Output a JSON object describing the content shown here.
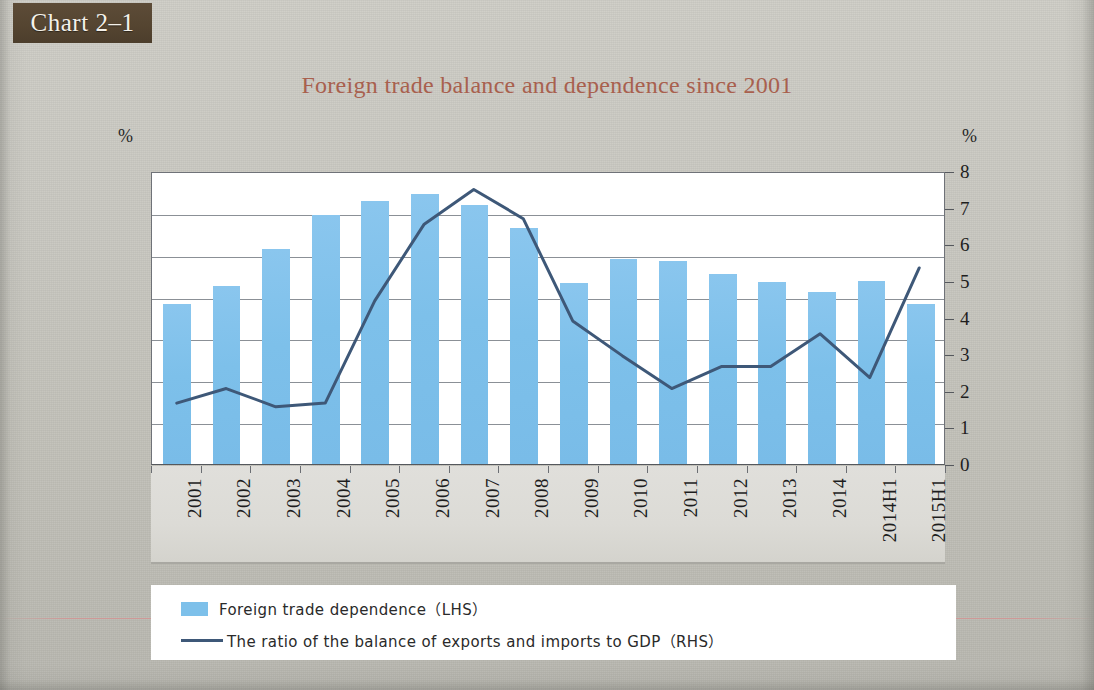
{
  "badge": {
    "label": "Chart 2–1"
  },
  "title": "Foreign trade balance and dependence since 2001",
  "axes": {
    "left_unit": "%",
    "right_unit": "%"
  },
  "colors": {
    "bar": "#7dc0ea",
    "line": "#3e5878",
    "title": "#a8604e",
    "badge_bg": "#554531",
    "page_bg": "#c7c6bf",
    "plot_bg": "#ffffff",
    "gridline": "#8b9096",
    "category_band": "#dcdbd6"
  },
  "legend": {
    "items": [
      {
        "marker": "box",
        "label": "Foreign  trade  dependence（LHS）"
      },
      {
        "marker": "line",
        "label": "The ratio of the balance of exports and imports to GDP（RHS）"
      }
    ]
  },
  "chart_data": {
    "type": "bar",
    "title": "Foreign trade balance and dependence since 2001",
    "xlabel": "",
    "ylabel": "%",
    "y2label": "%",
    "ylim": [
      0,
      70
    ],
    "y2lim": [
      0,
      8
    ],
    "yticks": [
      0,
      10,
      20,
      30,
      40,
      50,
      60,
      70
    ],
    "y2ticks": [
      0,
      1,
      2,
      3,
      4,
      5,
      6,
      7,
      8
    ],
    "ytick_labels": [
      "0",
      "10",
      "20",
      "30",
      "40",
      "50",
      "60",
      "70"
    ],
    "y2tick_labels": [
      "0",
      "1",
      "2",
      "3",
      "4",
      "5",
      "6",
      "7",
      "8"
    ],
    "grid": true,
    "legend_position": "bottom",
    "categories": [
      "2001",
      "2002",
      "2003",
      "2004",
      "2005",
      "2006",
      "2007",
      "2008",
      "2009",
      "2010",
      "2011",
      "2012",
      "2013",
      "2014",
      "2014H1",
      "2015H1"
    ],
    "series": [
      {
        "name": "Foreign  trade  dependence（LHS）",
        "type": "bar",
        "axis": "left",
        "unit": "%",
        "values": [
          38.2,
          42.5,
          51.4,
          59.4,
          62.8,
          64.6,
          62.0,
          56.5,
          43.3,
          49.0,
          48.5,
          45.3,
          43.5,
          41.0,
          43.8,
          38.3
        ]
      },
      {
        "name": "The ratio of the balance of exports and imports to GDP（RHS）",
        "type": "line",
        "axis": "right",
        "unit": "%",
        "values": [
          1.7,
          2.1,
          1.6,
          1.7,
          4.5,
          6.6,
          7.55,
          6.75,
          3.95,
          3.0,
          2.1,
          2.7,
          2.7,
          3.6,
          2.4,
          5.4
        ]
      }
    ]
  }
}
